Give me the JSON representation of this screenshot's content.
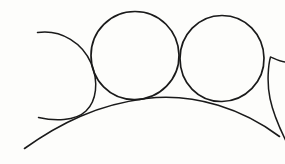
{
  "figure": {
    "title": "Hand-drawn geometric sketch of tangent circles on an arc",
    "canvas": {
      "width": 285,
      "height": 164,
      "background_color": "#fdfdfb"
    },
    "style": {
      "stroke_color": "#1a1a1a",
      "stroke_width": 1.6,
      "stroke_width_thin": 1.35,
      "fill": "none",
      "line_cap": "round",
      "rendering": "hand-drawn pen sketch"
    },
    "elements": [
      {
        "name": "base-arc",
        "kind": "arc",
        "role": "large shallow arc forming the ground curve",
        "center_x": 150,
        "center_y": 430,
        "radius": 332,
        "apex_x": 146,
        "apex_y": 98,
        "start_x": 24,
        "start_y": 148,
        "end_x": 279,
        "end_y": 136,
        "path": "M 24.5 148.5 C 60 123 98 104.5 146 98.5 C 196 92.5 244 110 279.5 136.5"
      },
      {
        "name": "circle-left-partial",
        "kind": "circle-arc",
        "role": "leftmost circle, open arc cropped at left frame edge",
        "center_x": 50,
        "center_y": 74,
        "radius": 44,
        "complete": false,
        "gap_side": "left",
        "top_end_x": 37,
        "top_end_y": 32,
        "bottom_end_x": 38,
        "bottom_end_y": 118,
        "path": "M 37.5 32.5 C 62 29 83 44 91 63 C 99 82 96.5 101 86 111 C 75 121.5 54 121 38.5 117.5"
      },
      {
        "name": "circle-center-left",
        "kind": "circle",
        "role": "first complete circle, tangent to base arc and neighbours",
        "center_x": 135,
        "center_y": 55,
        "radius": 44,
        "complete": true,
        "top_y": 11,
        "bottom_y": 99,
        "left_x": 91,
        "right_x": 179,
        "path": "M 135 11.5 C 159.5 11.5 178.5 31 179 55 C 179.5 79 160 99 135 99.5 C 110 100 91 80 91 55.5 C 91 31 110.5 11.5 135 11.5 Z"
      },
      {
        "name": "circle-center-right",
        "kind": "circle",
        "role": "second complete circle, tangent to base arc and neighbours",
        "center_x": 222,
        "center_y": 58,
        "radius": 43,
        "complete": true,
        "top_y": 15,
        "bottom_y": 101,
        "left_x": 180,
        "right_x": 264,
        "path": "M 222 15.5 C 245.5 15.5 263.5 34.5 264 58 C 264.5 81.5 245.5 101 222 101.5 C 198.5 102 180 83 180 58.5 C 180 35 198.5 15.5 222 15.5 Z"
      },
      {
        "name": "circle-right-partial",
        "kind": "circle-arc",
        "role": "rightmost circle, open arc cropped at right frame edge",
        "center_x": 300,
        "center_y": 88,
        "radius": 43,
        "complete": false,
        "gap_side": "right",
        "top_end_x": 285,
        "top_end_y": 62,
        "bottom_end_x": 285,
        "bottom_end_y": 140,
        "path": "M 285.5 62 C 279 61.5 272.5 57.5 270.5 57 C 268.5 64 266.5 82 270 98.5 C 273.5 115 281 131 286 141"
      }
    ],
    "tangency_points": [
      {
        "name": "cusp-left",
        "x": 86,
        "y": 110
      },
      {
        "name": "cusp-center",
        "x": 180,
        "y": 98
      },
      {
        "name": "cusp-right",
        "x": 265,
        "y": 110
      }
    ]
  }
}
